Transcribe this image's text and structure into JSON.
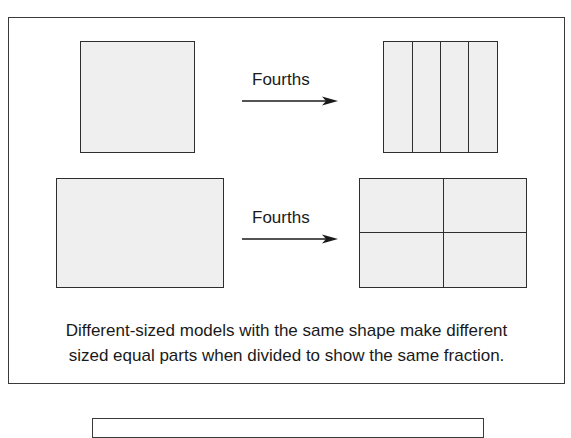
{
  "figure": {
    "rows": [
      {
        "original": {
          "shape": "square",
          "fill": "#efefef"
        },
        "arrow": {
          "label": "Fourths",
          "direction": "right"
        },
        "divided": {
          "shape": "square",
          "division": "vertical-strips",
          "parts": 4
        }
      },
      {
        "original": {
          "shape": "rectangle",
          "fill": "#efefef"
        },
        "arrow": {
          "label": "Fourths",
          "direction": "right"
        },
        "divided": {
          "shape": "rectangle",
          "division": "2x2-grid",
          "parts": 4
        }
      }
    ],
    "caption": {
      "line1": "Different-sized models with the same shape make different",
      "line2": "sized equal parts when divided to show the same fraction."
    }
  },
  "colors": {
    "shape_fill": "#efefef",
    "stroke": "#2e2e2e",
    "background": "#ffffff"
  }
}
